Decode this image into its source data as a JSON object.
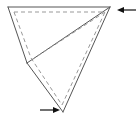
{
  "figure": {
    "type": "geometric-line-drawing",
    "canvas": {
      "width": 138,
      "height": 121,
      "background": "#ffffff"
    },
    "style": {
      "solid_stroke_color": "#555555",
      "dashed_stroke_color": "#999999",
      "arrow_color": "#111111",
      "solid_stroke_width": 1,
      "dashed_stroke_width": 1,
      "dash_pattern": "4 3"
    },
    "vertices": {
      "top_left": {
        "x": 8,
        "y": 7
      },
      "top_right": {
        "x": 110,
        "y": 7
      },
      "mid_left": {
        "x": 27,
        "y": 63
      },
      "bottom": {
        "x": 63,
        "y": 112
      },
      "inner_right": {
        "x": 107,
        "y": 11
      }
    },
    "solid_paths": [
      {
        "name": "top-edge",
        "points": "8,7 110,7"
      },
      {
        "name": "left-upper-edge",
        "points": "8,7 27,63"
      },
      {
        "name": "mid-left-to-bottom-edge",
        "points": "27,63 63,112"
      },
      {
        "name": "bottom-to-top-right-edge",
        "points": "63,112 110,7"
      },
      {
        "name": "top-right-to-mid-left-edge",
        "points": "110,7 27,63"
      }
    ],
    "dashed_paths": [
      {
        "name": "fold-line-top",
        "points": "14,12 105,12"
      },
      {
        "name": "fold-line-left",
        "points": "14,12 31,58"
      },
      {
        "name": "fold-line-mid-to-bottom",
        "points": "31,58 62,105"
      },
      {
        "name": "fold-line-bottom-to-right",
        "points": "62,105 105,12"
      },
      {
        "name": "fold-line-right-to-mid",
        "points": "105,12 33,59"
      }
    ],
    "arrows": [
      {
        "name": "arrow-top-right",
        "direction": "left",
        "tail": {
          "x": 136,
          "y": 10
        },
        "head": {
          "x": 117,
          "y": 10
        }
      },
      {
        "name": "arrow-bottom",
        "direction": "right",
        "tail": {
          "x": 40,
          "y": 110
        },
        "head": {
          "x": 60,
          "y": 110
        }
      }
    ]
  }
}
